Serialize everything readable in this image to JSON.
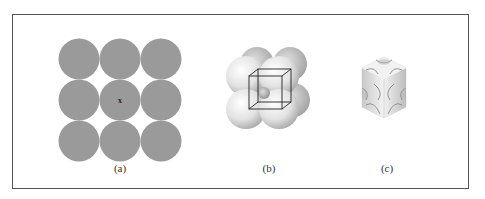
{
  "figure": {
    "panels": [
      {
        "id": "a",
        "label": "(a)",
        "description": "3x3 square arrangement of atoms (top view)",
        "center_marker": "x"
      },
      {
        "id": "b",
        "label": "(b)",
        "description": "Space-filling model of simple cubic unit cell with cube outline"
      },
      {
        "id": "c",
        "label": "(c)",
        "description": "Simple cubic unit cell showing atom portions within cube"
      }
    ],
    "colors": {
      "atom_fill_2d": "#9a9a9a",
      "atom_fill_3d": "#e6e6e6",
      "frame_border": "#555555",
      "cube_lines": "#222222"
    }
  }
}
